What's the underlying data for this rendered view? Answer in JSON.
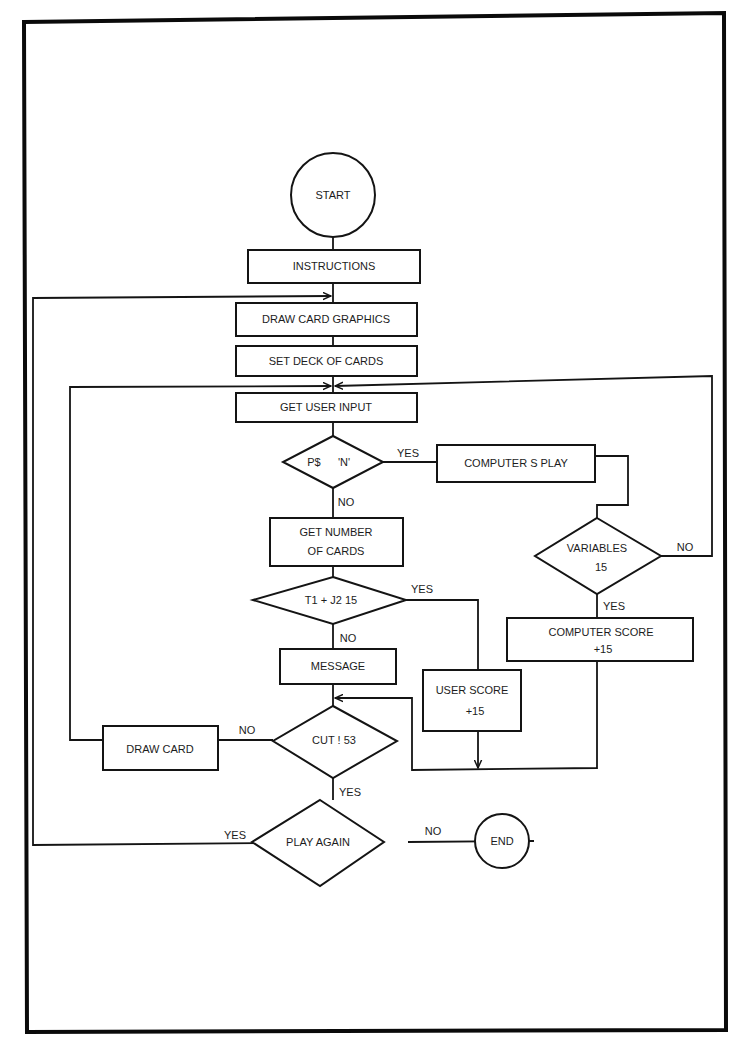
{
  "diagram": {
    "type": "flowchart",
    "nodes": {
      "start": {
        "shape": "terminal-circle",
        "label": "START"
      },
      "instructions": {
        "shape": "process",
        "label": "INSTRUCTIONS"
      },
      "draw_card_graphics": {
        "shape": "process",
        "label": "DRAW CARD GRAPHICS"
      },
      "set_deck": {
        "shape": "process",
        "label": "SET DECK OF CARDS"
      },
      "get_user_input": {
        "shape": "process",
        "label": "GET USER INPUT"
      },
      "decision_ps": {
        "shape": "decision",
        "label_left": "P$",
        "label_right": "'N'"
      },
      "computers_play": {
        "shape": "process",
        "label": "COMPUTER S PLAY"
      },
      "decision_variables": {
        "shape": "decision",
        "line1": "VARIABLES",
        "line2": "15"
      },
      "computer_score": {
        "shape": "process",
        "line1": "COMPUTER SCORE",
        "line2": "+15"
      },
      "get_number": {
        "shape": "process",
        "line1": "GET NUMBER",
        "line2": "OF CARDS"
      },
      "decision_t1j2": {
        "shape": "decision",
        "label": "T1 + J2   15"
      },
      "message": {
        "shape": "process",
        "label": "MESSAGE"
      },
      "user_score": {
        "shape": "process",
        "line1": "USER SCORE",
        "line2": "+15"
      },
      "decision_cut": {
        "shape": "decision",
        "label": "CUT !   53"
      },
      "draw_card": {
        "shape": "process",
        "label": "DRAW CARD"
      },
      "decision_play_again": {
        "shape": "decision",
        "label": "PLAY AGAIN"
      },
      "end": {
        "shape": "terminal-circle",
        "label": "END"
      }
    },
    "edge_labels": {
      "ps_yes": "YES",
      "ps_no": "NO",
      "variables_no": "NO",
      "variables_yes": "YES",
      "t1j2_yes": "YES",
      "t1j2_no": "NO",
      "cut_no": "NO",
      "cut_yes": "YES",
      "play_again_yes": "YES",
      "play_again_no": "NO"
    },
    "edges": [
      {
        "from": "start",
        "to": "instructions"
      },
      {
        "from": "instructions",
        "to": "draw_card_graphics"
      },
      {
        "from": "draw_card_graphics",
        "to": "set_deck"
      },
      {
        "from": "set_deck",
        "to": "get_user_input"
      },
      {
        "from": "get_user_input",
        "to": "decision_ps"
      },
      {
        "from": "decision_ps",
        "to": "computers_play",
        "label": "YES"
      },
      {
        "from": "decision_ps",
        "to": "get_number",
        "label": "NO"
      },
      {
        "from": "computers_play",
        "to": "decision_variables"
      },
      {
        "from": "decision_variables",
        "to": "get_user_input",
        "label": "NO"
      },
      {
        "from": "decision_variables",
        "to": "computer_score",
        "label": "YES"
      },
      {
        "from": "get_number",
        "to": "decision_t1j2"
      },
      {
        "from": "decision_t1j2",
        "to": "user_score",
        "label": "YES"
      },
      {
        "from": "decision_t1j2",
        "to": "message",
        "label": "NO"
      },
      {
        "from": "message",
        "to": "decision_cut"
      },
      {
        "from": "user_score",
        "to": "decision_cut"
      },
      {
        "from": "computer_score",
        "to": "decision_cut"
      },
      {
        "from": "decision_cut",
        "to": "draw_card",
        "label": "NO"
      },
      {
        "from": "draw_card",
        "to": "get_user_input"
      },
      {
        "from": "decision_cut",
        "to": "decision_play_again",
        "label": "YES"
      },
      {
        "from": "decision_play_again",
        "to": "draw_card_graphics",
        "label": "YES"
      },
      {
        "from": "decision_play_again",
        "to": "end",
        "label": "NO"
      }
    ]
  },
  "colors": {
    "ink": "#141414",
    "paper": "#ffffff"
  }
}
